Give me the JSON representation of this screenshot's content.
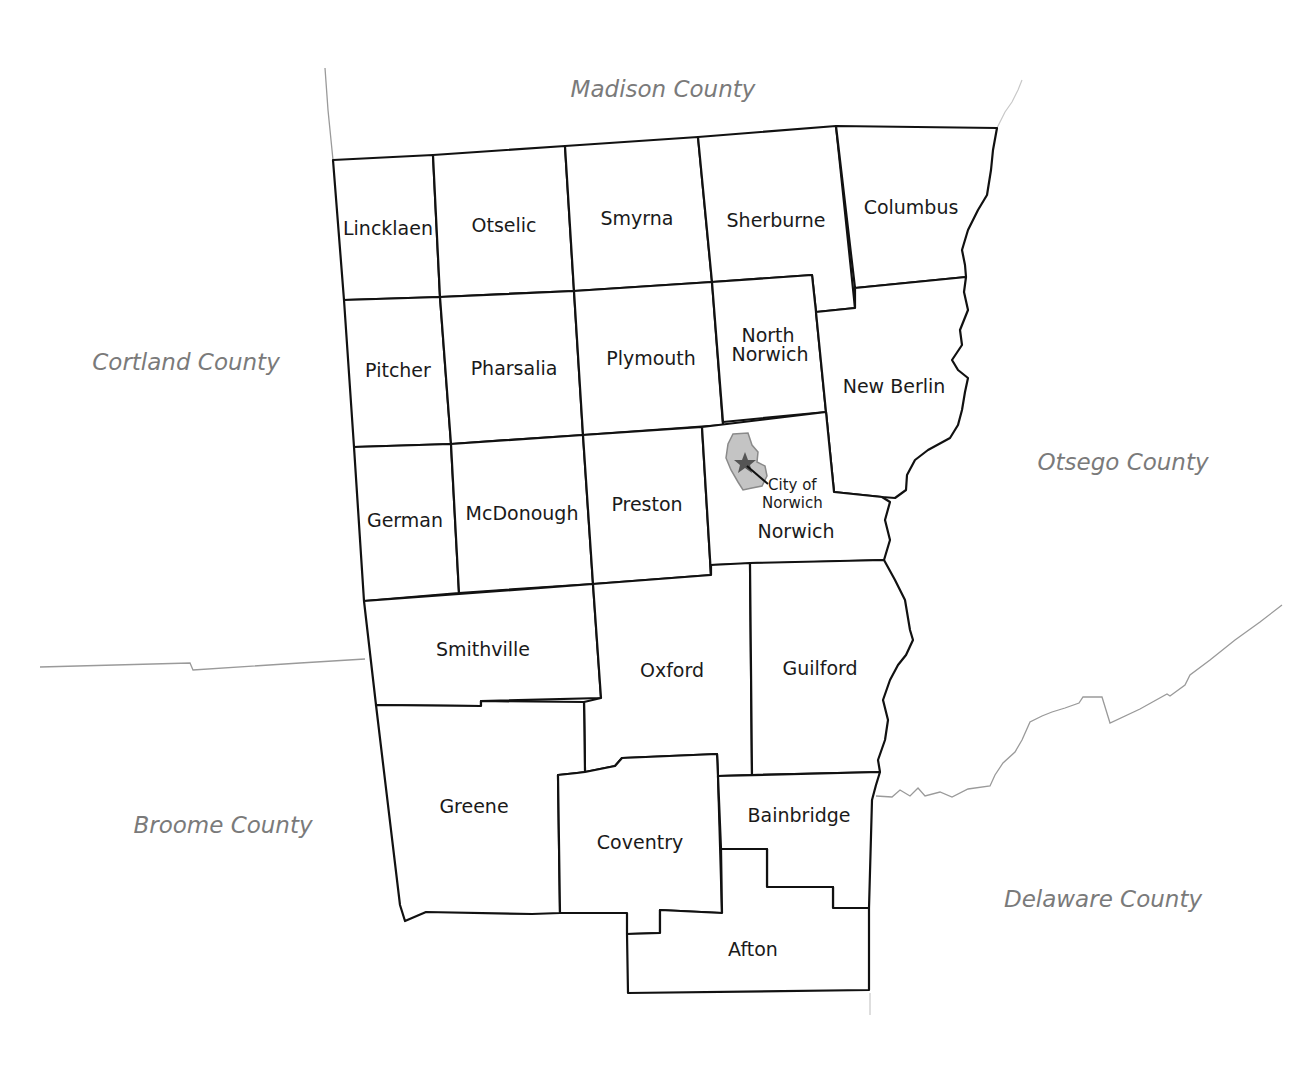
{
  "map": {
    "neighboring_counties": [
      {
        "id": "madison",
        "label": "Madison County",
        "x": 663,
        "y": 97
      },
      {
        "id": "cortland",
        "label": "Cortland County",
        "x": 186,
        "y": 370
      },
      {
        "id": "otsego",
        "label": "Otsego County",
        "x": 1123,
        "y": 470
      },
      {
        "id": "broome",
        "label": "Broome County",
        "x": 223,
        "y": 833
      },
      {
        "id": "delaware",
        "label": "Delaware County",
        "x": 1103,
        "y": 907
      }
    ],
    "towns": [
      {
        "id": "lincklaen",
        "label": "Lincklaen"
      },
      {
        "id": "otselic",
        "label": "Otselic"
      },
      {
        "id": "smyrna",
        "label": "Smyrna"
      },
      {
        "id": "sherburne",
        "label": "Sherburne"
      },
      {
        "id": "columbus",
        "label": "Columbus"
      },
      {
        "id": "pitcher",
        "label": "Pitcher"
      },
      {
        "id": "pharsalia",
        "label": "Pharsalia"
      },
      {
        "id": "plymouth",
        "label": "Plymouth"
      },
      {
        "id": "north-norwich",
        "label_line1": "North",
        "label_line2": "Norwich"
      },
      {
        "id": "new-berlin",
        "label": "New Berlin"
      },
      {
        "id": "german",
        "label": "German"
      },
      {
        "id": "mcdonough",
        "label": "McDonough"
      },
      {
        "id": "preston",
        "label": "Preston"
      },
      {
        "id": "norwich",
        "label": "Norwich"
      },
      {
        "id": "smithville",
        "label": "Smithville"
      },
      {
        "id": "oxford",
        "label": "Oxford"
      },
      {
        "id": "guilford",
        "label": "Guilford"
      },
      {
        "id": "greene",
        "label": "Greene"
      },
      {
        "id": "coventry",
        "label": "Coventry"
      },
      {
        "id": "bainbridge",
        "label": "Bainbridge"
      },
      {
        "id": "afton",
        "label": "Afton"
      }
    ],
    "city": {
      "label_line1": "City of",
      "label_line2": "Norwich",
      "marker": "star-icon",
      "fill_color": "#c4c4c4",
      "star_color": "#555555"
    },
    "colors": {
      "town_border": "#111111",
      "county_line": "#9a9a9a",
      "county_label": "#7a7a7a",
      "background": "#ffffff"
    }
  }
}
